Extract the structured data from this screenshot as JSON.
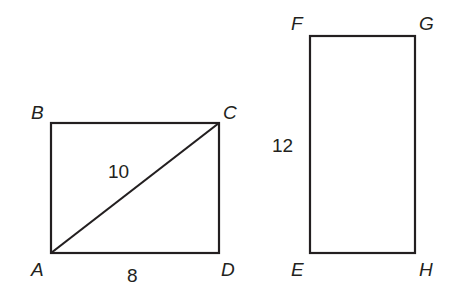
{
  "figure": {
    "rect1": {
      "vertices": {
        "A": "A",
        "B": "B",
        "C": "C",
        "D": "D"
      },
      "diagonal_label": "10",
      "bottom_label": "8"
    },
    "rect2": {
      "vertices": {
        "E": "E",
        "F": "F",
        "G": "G",
        "H": "H"
      },
      "side_label": "12"
    },
    "stroke_color": "#231f20"
  }
}
